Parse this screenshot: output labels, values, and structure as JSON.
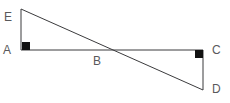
{
  "figure": {
    "background_color": "#ffffff",
    "line_color": "#3b3b3d",
    "label_color": "#59595b",
    "marker_color": "#111111",
    "points": [
      {
        "id": "E",
        "label": "E",
        "x": 21,
        "y": 9,
        "label_x": 4,
        "label_y": 11
      },
      {
        "id": "A",
        "label": "A",
        "x": 21,
        "y": 50,
        "label_x": 3,
        "label_y": 44
      },
      {
        "id": "B",
        "label": "B",
        "x": 107,
        "y": 50,
        "label_x": 93,
        "label_y": 55
      },
      {
        "id": "C",
        "label": "C",
        "x": 203,
        "y": 50,
        "label_x": 212,
        "label_y": 44
      },
      {
        "id": "D",
        "label": "D",
        "x": 203,
        "y": 90,
        "label_x": 212,
        "label_y": 83
      }
    ],
    "segments": [
      {
        "id": "EA",
        "from": "E",
        "to": "A",
        "x1": 21,
        "y1": 9,
        "x2": 21,
        "y2": 50
      },
      {
        "id": "AC",
        "from": "A",
        "to": "C",
        "x1": 21,
        "y1": 50,
        "x2": 203,
        "y2": 50
      },
      {
        "id": "ED",
        "from": "E",
        "to": "D",
        "x1": 21,
        "y1": 9,
        "x2": 203,
        "y2": 90
      },
      {
        "id": "CD",
        "from": "C",
        "to": "D",
        "x1": 203,
        "y1": 50,
        "x2": 203,
        "y2": 90
      }
    ],
    "right_angle_markers": [
      {
        "id": "angle-A",
        "at": "A",
        "x": 22,
        "y": 42,
        "size": 8
      },
      {
        "id": "angle-C",
        "at": "C",
        "x": 195,
        "y": 50,
        "size": 8
      }
    ]
  }
}
